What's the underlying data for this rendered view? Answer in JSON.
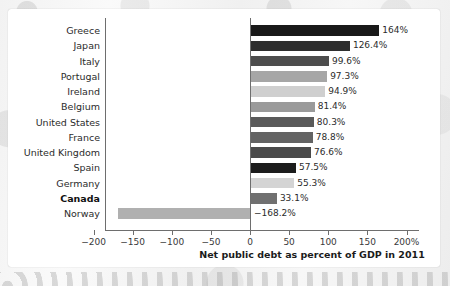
{
  "chart_data": {
    "type": "bar",
    "orientation": "horizontal",
    "title": "",
    "xlabel": "Net public debt as percent of GDP in 2011",
    "ylabel": "",
    "xlim": [
      -200,
      200
    ],
    "grid": false,
    "legend": null,
    "zero_line": true,
    "categories": [
      "Greece",
      "Japan",
      "Italy",
      "Portugal",
      "Ireland",
      "Belgium",
      "United States",
      "France",
      "United Kingdom",
      "Spain",
      "Germany",
      "Canada",
      "Norway"
    ],
    "values": [
      164,
      126.4,
      99.6,
      97.3,
      94.9,
      81.4,
      80.3,
      78.8,
      76.6,
      57.5,
      55.3,
      33.1,
      -168.2
    ],
    "value_labels": [
      "164%",
      "126.4%",
      "99.6%",
      "97.3%",
      "94.9%",
      "81.4%",
      "80.3%",
      "78.8%",
      "76.6%",
      "57.5%",
      "55.3%",
      "33.1%",
      "−168.2%"
    ],
    "bar_colors": [
      "#191919",
      "#2e2e2e",
      "#4d4d4d",
      "#a6a6a6",
      "#cfcfcf",
      "#9a9a9a",
      "#5a5a5a",
      "#636363",
      "#4a4a4a",
      "#1c1c1c",
      "#d4d4d4",
      "#707070",
      "#b0b0b0"
    ],
    "highlight_category": "Canada",
    "xticks": [
      -200,
      -150,
      -100,
      -50,
      0,
      50,
      100,
      150,
      200
    ],
    "xtick_labels": [
      "−200",
      "−150",
      "−100",
      "−50",
      "0",
      "50",
      "100",
      "150",
      "200%"
    ]
  },
  "colors": {
    "axis": "#6e6e6e",
    "text": "#2b2b2b",
    "figure_background": "#ffffff",
    "page_background": "#f2f2f2"
  }
}
